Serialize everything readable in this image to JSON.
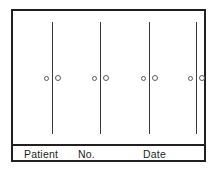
{
  "document": {
    "kind": "printed-form-diagram",
    "title": "Patient record form with four vertical rating scales"
  },
  "colors": {
    "border": "#231f20",
    "scale_line": "#3a3a3c",
    "marker_stroke": "#5a5a5e",
    "paper": "#ffffff",
    "text": "#231f20"
  },
  "scales": [
    {
      "name": "scale-1",
      "left": 25,
      "markers": [
        {
          "side": "left",
          "label": "o"
        },
        {
          "side": "right",
          "label": "o"
        }
      ]
    },
    {
      "name": "scale-2",
      "left": 73,
      "markers": [
        {
          "side": "left",
          "label": "o"
        },
        {
          "side": "right",
          "label": "o"
        }
      ]
    },
    {
      "name": "scale-3",
      "left": 122,
      "markers": [
        {
          "side": "left",
          "label": "o"
        },
        {
          "side": "right",
          "label": "o"
        }
      ]
    },
    {
      "name": "scale-4",
      "left": 169,
      "markers": [
        {
          "side": "left",
          "label": "o"
        },
        {
          "side": "right",
          "label": "o"
        }
      ]
    }
  ],
  "footer": {
    "fields": [
      {
        "label": "Patient",
        "value": ""
      },
      {
        "label": "No.",
        "value": ""
      },
      {
        "label": "Date",
        "value": ""
      }
    ],
    "patient_label": "Patient",
    "no_label": "No.",
    "date_label": "Date"
  }
}
